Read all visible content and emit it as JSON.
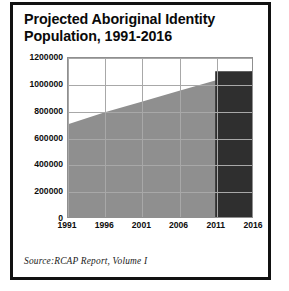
{
  "title": {
    "line1": "Projected Aboriginal Identity",
    "line2": "Population, 1991-2016"
  },
  "source": {
    "text": "Source:RCAP Report, Volume I"
  },
  "colors": {
    "area_light": "#8f8f8f",
    "area_dark": "#2f2f2f",
    "gridline": "#a8a8a8",
    "axis": "#8f8f8f",
    "text": "#0d0d0d",
    "rule": "#111111"
  },
  "chart_data": {
    "type": "area",
    "title": "Projected Aboriginal Identity Population, 1991-2016",
    "xlabel": "",
    "ylabel": "",
    "categories": [
      "1991",
      "1996",
      "2001",
      "2006",
      "2011",
      "2016"
    ],
    "x": [
      1991,
      1996,
      2001,
      2006,
      2011,
      2016
    ],
    "values": [
      700000,
      790000,
      870000,
      950000,
      1030000,
      1100000
    ],
    "ylim": [
      0,
      1200000
    ],
    "yticks": [
      0,
      200000,
      400000,
      600000,
      800000,
      1000000,
      1200000
    ],
    "ytick_labels": [
      "0",
      "200000",
      "400000",
      "600000",
      "800000",
      "1000000",
      "1200000"
    ],
    "grid": true,
    "legend": "none",
    "annotations": [
      {
        "label": "projection-segment",
        "from": "2011",
        "to": "2016",
        "style": "dark-fill",
        "note": "Final 2011-2016 interval drawn as a flat-topped dark block at 1100000"
      }
    ]
  }
}
